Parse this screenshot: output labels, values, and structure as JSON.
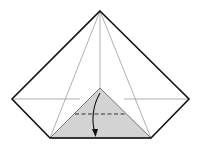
{
  "diagram": {
    "type": "origami-fold-step",
    "colors": {
      "outline": "#111111",
      "crease": "#9a9a9a",
      "shaded_flap": "#d3d3d3",
      "background": "#ffffff",
      "fold_line": "#333333",
      "arrow": "#111111"
    },
    "elements": [
      "outer-outline",
      "crease-lines",
      "horizontal-crease",
      "shaded-triangle-flap",
      "valley-fold-dashed-line",
      "fold-arrow"
    ]
  }
}
